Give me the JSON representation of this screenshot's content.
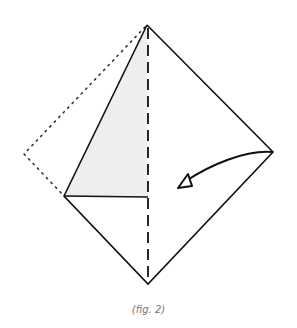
{
  "figure": {
    "caption": "(fig. 2)",
    "colors": {
      "line": "#111111",
      "shade": "#eeeeee",
      "caption": "#777777"
    },
    "points": {
      "top": [
        147,
        25
      ],
      "left": [
        64,
        196
      ],
      "right": [
        273,
        152
      ],
      "bottom": [
        148,
        284
      ],
      "mid": [
        148,
        197
      ],
      "folded_corner": [
        24,
        154
      ]
    },
    "arrow": {
      "from": [
        272,
        152
      ],
      "to": [
        180,
        186
      ],
      "direction": "fold-left"
    }
  }
}
